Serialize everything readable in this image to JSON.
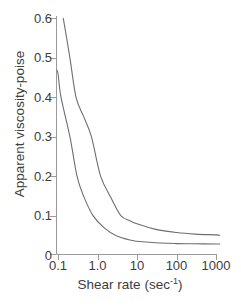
{
  "figure": {
    "background": "#ffffff",
    "text_color": "#3d3d3d",
    "axis_color": "#9b9b9b",
    "curve_color": "#6e6e6e"
  },
  "chart_data": {
    "type": "line",
    "title": "",
    "xlabel": "Shear rate (sec⁻¹)",
    "xlabel_parts": {
      "prefix": "Shear rate (sec",
      "sup": "-1",
      "suffix": ")"
    },
    "ylabel": "Apparent viscosity-poise",
    "x_scale": "log",
    "y_scale": "linear",
    "xlim": [
      0.1,
      1000
    ],
    "ylim": [
      0,
      0.6
    ],
    "grid": false,
    "legend_position": "none",
    "x_ticks": {
      "values": [
        0.1,
        1,
        10,
        100,
        1000
      ],
      "labels": [
        "0.1",
        "1.0",
        "10",
        "100",
        "1000"
      ]
    },
    "y_ticks": {
      "values": [
        0,
        0.1,
        0.2,
        0.3,
        0.4,
        0.5,
        0.6
      ],
      "labels": [
        "0",
        "0.1",
        "0.2",
        "0.3",
        "0.4",
        "0.5",
        "0.6"
      ]
    },
    "series": [
      {
        "name": "upper-curve",
        "points": [
          [
            0.136,
            0.6
          ],
          [
            0.2,
            0.5
          ],
          [
            0.286,
            0.4
          ],
          [
            0.45,
            0.35
          ],
          [
            0.7,
            0.3
          ],
          [
            1.2,
            0.2
          ],
          [
            2.2,
            0.145
          ],
          [
            3.9,
            0.1
          ],
          [
            6.6,
            0.087
          ],
          [
            10,
            0.079
          ],
          [
            30,
            0.065
          ],
          [
            100,
            0.057
          ],
          [
            300,
            0.053
          ],
          [
            1000,
            0.051
          ],
          [
            1250,
            0.05
          ]
        ]
      },
      {
        "name": "lower-curve",
        "points": [
          [
            0.09,
            0.47
          ],
          [
            0.1,
            0.46
          ],
          [
            0.119,
            0.4
          ],
          [
            0.2,
            0.3
          ],
          [
            0.303,
            0.2
          ],
          [
            0.45,
            0.148
          ],
          [
            0.77,
            0.1
          ],
          [
            1.5,
            0.068
          ],
          [
            3,
            0.049
          ],
          [
            6.6,
            0.038
          ],
          [
            10,
            0.035
          ],
          [
            30,
            0.031
          ],
          [
            100,
            0.029
          ],
          [
            300,
            0.0285
          ],
          [
            1000,
            0.028
          ],
          [
            1250,
            0.028
          ]
        ]
      }
    ]
  }
}
